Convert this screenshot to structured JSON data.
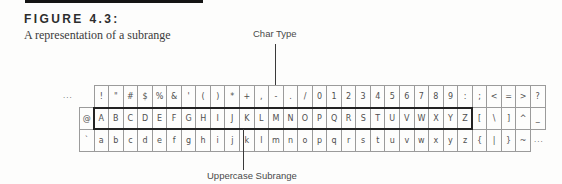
{
  "header": {
    "figure_label": "FIGURE 4.3:",
    "caption": "A representation of a subrange"
  },
  "annotations": {
    "char_type": {
      "label": "Char Type",
      "points_to": "char row cell"
    },
    "uppercase_subrange": {
      "label": "Uppercase Subrange",
      "points_to": "boxed cells A-Z"
    }
  },
  "table": {
    "left_ellipsis": "...",
    "right_ellipsis": "...",
    "rows": [
      {
        "name": "punctuation-and-digits",
        "offset_cells": 1,
        "cells": [
          "!",
          "\"",
          "#",
          "$",
          "%",
          "&",
          "'",
          "(",
          ")",
          "*",
          "+",
          ",",
          "-",
          ".",
          "/",
          "0",
          "1",
          "2",
          "3",
          "4",
          "5",
          "6",
          "7",
          "8",
          "9",
          ":",
          ";",
          "<",
          "=",
          ">",
          "?"
        ]
      },
      {
        "name": "uppercase",
        "offset_cells": 0,
        "cells": [
          "@",
          "A",
          "B",
          "C",
          "D",
          "E",
          "F",
          "G",
          "H",
          "I",
          "J",
          "K",
          "L",
          "M",
          "N",
          "O",
          "P",
          "Q",
          "R",
          "S",
          "T",
          "U",
          "V",
          "W",
          "X",
          "Y",
          "Z",
          "[",
          "\\",
          "]",
          "^",
          "_"
        ],
        "subrange": {
          "start_cell": 1,
          "end_cell": 26
        }
      },
      {
        "name": "lowercase",
        "offset_cells": 0,
        "cells": [
          "`",
          "a",
          "b",
          "c",
          "d",
          "e",
          "f",
          "g",
          "h",
          "i",
          "j",
          "k",
          "l",
          "m",
          "n",
          "o",
          "p",
          "q",
          "r",
          "s",
          "t",
          "u",
          "v",
          "w",
          "x",
          "y",
          "z",
          "{",
          "|",
          "}",
          "~"
        ]
      }
    ]
  },
  "colors": {
    "rule": "#141414",
    "grid_line": "#9b9b9b",
    "subrange_border": "#222222",
    "text": "#4a4a4a",
    "background": "#fdfdfc"
  }
}
